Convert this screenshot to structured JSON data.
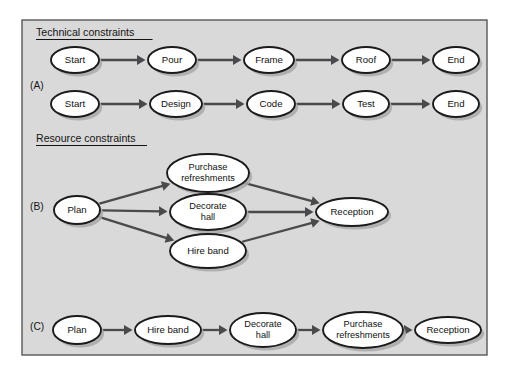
{
  "figure": {
    "panel": {
      "x": 22,
      "y": 20,
      "width": 465,
      "height": 335,
      "background_color": "#d9d9d9",
      "border_color": "#58585a"
    },
    "colors": {
      "node_fill": "#ffffff",
      "node_stroke": "#1b1b1b",
      "edge": "#4a4a4c",
      "shadow": "#a8a8a8",
      "text": "#141414"
    }
  },
  "headings": [
    {
      "id": "technical",
      "label": "Technical constraints",
      "x": 36,
      "y": 36
    },
    {
      "id": "resource",
      "label": "Resource constraints",
      "x": 36,
      "y": 142
    }
  ],
  "row_labels": [
    {
      "id": "row-a",
      "label": "(A)",
      "x": 30,
      "y": 89
    },
    {
      "id": "row-b",
      "label": "(B)",
      "x": 30,
      "y": 210
    },
    {
      "id": "row-c",
      "label": "(C)",
      "x": 30,
      "y": 330
    }
  ],
  "graphs": [
    {
      "id": "graph-a1",
      "section": "Technical constraints",
      "row": "(A)",
      "type": "chain",
      "nodes": [
        {
          "id": "a1-start",
          "label": "Start",
          "cx": 75,
          "cy": 60,
          "rx": 24,
          "ry": 13
        },
        {
          "id": "a1-pour",
          "label": "Pour",
          "cx": 172,
          "cy": 60,
          "rx": 24,
          "ry": 13
        },
        {
          "id": "a1-frame",
          "label": "Frame",
          "cx": 269,
          "cy": 60,
          "rx": 25,
          "ry": 13
        },
        {
          "id": "a1-roof",
          "label": "Roof",
          "cx": 366,
          "cy": 60,
          "rx": 24,
          "ry": 13
        },
        {
          "id": "a1-end",
          "label": "End",
          "cx": 456,
          "cy": 60,
          "rx": 23,
          "ry": 13
        }
      ],
      "edges": [
        {
          "from": "a1-start",
          "to": "a1-pour"
        },
        {
          "from": "a1-pour",
          "to": "a1-frame"
        },
        {
          "from": "a1-frame",
          "to": "a1-roof"
        },
        {
          "from": "a1-roof",
          "to": "a1-end"
        }
      ]
    },
    {
      "id": "graph-a2",
      "section": "Technical constraints",
      "row": "(A)",
      "type": "chain",
      "nodes": [
        {
          "id": "a2-start",
          "label": "Start",
          "cx": 75,
          "cy": 104,
          "rx": 24,
          "ry": 13
        },
        {
          "id": "a2-design",
          "label": "Design",
          "cx": 176,
          "cy": 104,
          "rx": 26,
          "ry": 13
        },
        {
          "id": "a2-code",
          "label": "Code",
          "cx": 271,
          "cy": 104,
          "rx": 24,
          "ry": 13
        },
        {
          "id": "a2-test",
          "label": "Test",
          "cx": 366,
          "cy": 104,
          "rx": 23,
          "ry": 13
        },
        {
          "id": "a2-end",
          "label": "End",
          "cx": 456,
          "cy": 104,
          "rx": 23,
          "ry": 13
        }
      ],
      "edges": [
        {
          "from": "a2-start",
          "to": "a2-design"
        },
        {
          "from": "a2-design",
          "to": "a2-code"
        },
        {
          "from": "a2-code",
          "to": "a2-test"
        },
        {
          "from": "a2-test",
          "to": "a2-end"
        }
      ]
    },
    {
      "id": "graph-b",
      "section": "Resource constraints",
      "row": "(B)",
      "type": "parallel",
      "nodes": [
        {
          "id": "b-plan",
          "label": "Plan",
          "cx": 77,
          "cy": 210,
          "rx": 23,
          "ry": 14
        },
        {
          "id": "b-purchase",
          "label": "Purchase\nrefreshments",
          "cx": 208,
          "cy": 173,
          "rx": 41,
          "ry": 19
        },
        {
          "id": "b-decorate",
          "label": "Decorate\nhall",
          "cx": 208,
          "cy": 212,
          "rx": 38,
          "ry": 18
        },
        {
          "id": "b-hire",
          "label": "Hire band",
          "cx": 208,
          "cy": 251,
          "rx": 38,
          "ry": 17
        },
        {
          "id": "b-reception",
          "label": "Reception",
          "cx": 352,
          "cy": 212,
          "rx": 36,
          "ry": 14
        }
      ],
      "edges": [
        {
          "from": "b-plan",
          "to": "b-purchase"
        },
        {
          "from": "b-plan",
          "to": "b-decorate"
        },
        {
          "from": "b-plan",
          "to": "b-hire"
        },
        {
          "from": "b-purchase",
          "to": "b-reception"
        },
        {
          "from": "b-decorate",
          "to": "b-reception"
        },
        {
          "from": "b-hire",
          "to": "b-reception"
        }
      ]
    },
    {
      "id": "graph-c",
      "section": "Resource constraints",
      "row": "(C)",
      "type": "chain",
      "nodes": [
        {
          "id": "c-plan",
          "label": "Plan",
          "cx": 77,
          "cy": 330,
          "rx": 24,
          "ry": 14
        },
        {
          "id": "c-hire",
          "label": "Hire band",
          "cx": 168,
          "cy": 330,
          "rx": 33,
          "ry": 14
        },
        {
          "id": "c-decorate",
          "label": "Decorate\nhall",
          "cx": 263,
          "cy": 330,
          "rx": 33,
          "ry": 17
        },
        {
          "id": "c-purchase",
          "label": "Purchase\nrefreshments",
          "cx": 363,
          "cy": 330,
          "rx": 40,
          "ry": 18
        },
        {
          "id": "c-reception",
          "label": "Reception",
          "cx": 448,
          "cy": 330,
          "rx": 33,
          "ry": 13
        }
      ],
      "edges": [
        {
          "from": "c-plan",
          "to": "c-hire"
        },
        {
          "from": "c-hire",
          "to": "c-decorate"
        },
        {
          "from": "c-decorate",
          "to": "c-purchase"
        },
        {
          "from": "c-purchase",
          "to": "c-reception"
        }
      ]
    }
  ]
}
